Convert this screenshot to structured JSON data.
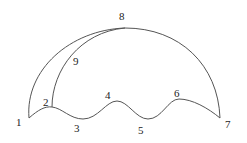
{
  "diagram": {
    "type": "curve-figure",
    "stroke_color": "#555555",
    "label_color": "#222222",
    "points": [
      {
        "id": "1",
        "label": "1",
        "x": 29,
        "y": 118,
        "lx": 16,
        "ly": 126
      },
      {
        "id": "2",
        "label": "2",
        "x": 52,
        "y": 107,
        "lx": 43,
        "ly": 106
      },
      {
        "id": "3",
        "label": "3",
        "x": 83,
        "y": 119,
        "lx": 74,
        "ly": 132
      },
      {
        "id": "4",
        "label": "4",
        "x": 117,
        "y": 101,
        "lx": 105,
        "ly": 99
      },
      {
        "id": "5",
        "label": "5",
        "x": 148,
        "y": 119,
        "lx": 138,
        "ly": 134
      },
      {
        "id": "6",
        "label": "6",
        "x": 179,
        "y": 99,
        "lx": 174,
        "ly": 97
      },
      {
        "id": "7",
        "label": "7",
        "x": 220,
        "y": 118,
        "lx": 225,
        "ly": 128
      },
      {
        "id": "8",
        "label": "8",
        "x": 125,
        "y": 28,
        "lx": 119,
        "ly": 20
      },
      {
        "id": "9",
        "label": "9",
        "x": 75,
        "y": 62,
        "lx": 73,
        "ly": 65
      }
    ],
    "paths": {
      "outer_arc": "M29,118 C25,70 70,30 125,28 C180,28 218,65 220,118",
      "inner_arc": "M52,107 C52,70 80,32 125,28",
      "wave": "M29,118 C38,110 45,106 52,107 C62,108 70,119 83,119 C98,119 106,101 117,101 C128,101 136,119 148,119 C162,119 168,99 179,99 C192,99 208,108 220,118"
    }
  }
}
